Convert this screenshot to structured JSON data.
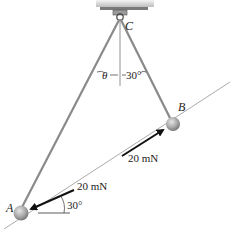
{
  "diagram": {
    "type": "statics-physics-figure",
    "points": {
      "A": {
        "label": "A"
      },
      "B": {
        "label": "B"
      },
      "C": {
        "label": "C"
      }
    },
    "angles": {
      "theta": {
        "label": "θ"
      },
      "rod_cb_angle": {
        "label": "30°"
      },
      "force_a_angle": {
        "label": "30°"
      }
    },
    "forces": {
      "at_b": {
        "label": "20 mN"
      },
      "at_a": {
        "label": "20 mN"
      }
    },
    "colors": {
      "rod": "#8a8a8a",
      "ball": "#9a9a9a",
      "arrow": "#111111",
      "ceiling": "#c8c8c8",
      "incline_line": "#aaaaaa"
    }
  }
}
